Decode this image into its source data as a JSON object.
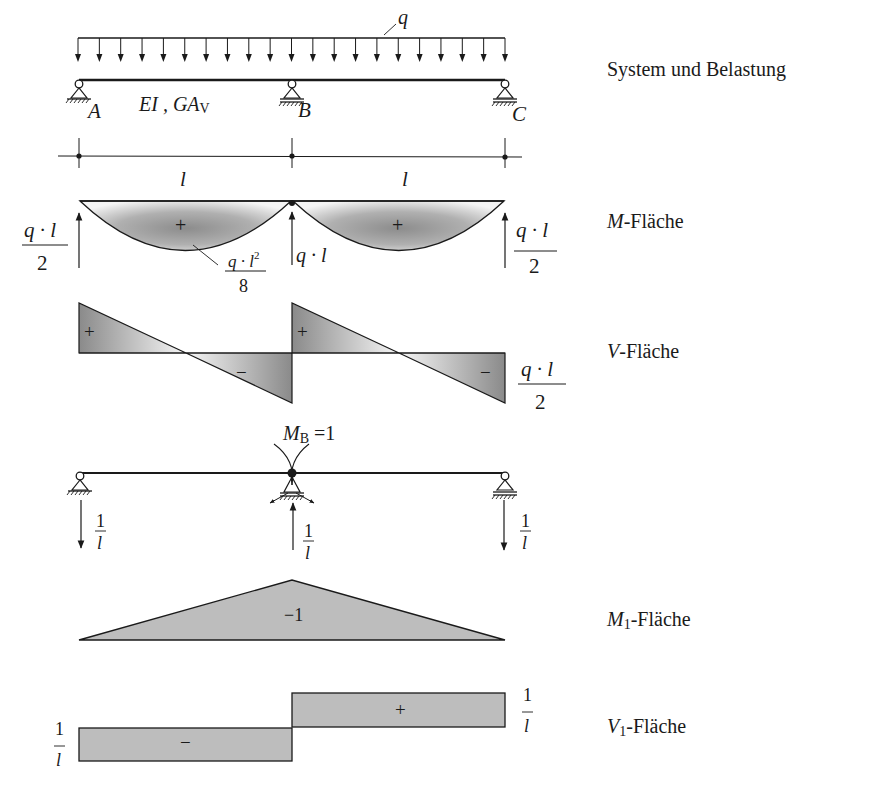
{
  "colors": {
    "ink": "#1a1a1a",
    "fill_gray": "#bdbdbd",
    "gradient_dark": "#8c8c8c",
    "gradient_light": "#f2f2f2"
  },
  "system": {
    "title": "System und Belastung",
    "load_label": "q",
    "stiffness_label": "EI , GA",
    "stiffness_sub": "V",
    "supports": [
      {
        "label": "A",
        "x": 79
      },
      {
        "label": "B",
        "x": 292
      },
      {
        "label": "C",
        "x": 505
      }
    ],
    "span_labels": [
      "l",
      "l"
    ],
    "load_arrow_count": 20
  },
  "m_diagram": {
    "title_var": "M",
    "title_rest": "-Fläche",
    "sign_left": "+",
    "sign_right": "+",
    "max_num": "q · l",
    "max_sup": "2",
    "max_den": "8",
    "reaction_end_num": "q · l",
    "reaction_end_den": "2",
    "reaction_mid": "q · l"
  },
  "v_diagram": {
    "title_var": "V",
    "title_rest": "-Fläche",
    "signs": [
      "+",
      "−",
      "+",
      "−"
    ],
    "value_num": "q · l",
    "value_den": "2"
  },
  "unit_system": {
    "moment_label": "M",
    "moment_sub": "B",
    "moment_value": " =1",
    "reaction_num": "1",
    "reaction_den": "l"
  },
  "m1_diagram": {
    "title_var": "M",
    "title_sub": "1",
    "title_rest": "-Fläche",
    "value": "−1"
  },
  "v1_diagram": {
    "title_var": "V",
    "title_sub": "1",
    "title_rest": "-Fläche",
    "sign_left": "−",
    "sign_right": "+",
    "value_num": "1",
    "value_den": "l"
  },
  "chart_data": {
    "type": "diagram",
    "spans": 2,
    "span_length": "l",
    "load": "uniform q",
    "M": {
      "field_max": "q·l²/8",
      "support_B": 0,
      "reactions": {
        "A": "q·l/2",
        "B": "q·l",
        "C": "q·l/2"
      }
    },
    "V": {
      "end_values": "±q·l/2"
    },
    "M1": {
      "at_B": -1,
      "at_A": 0,
      "at_C": 0
    },
    "V1": {
      "span1": "-1/l",
      "span2": "+1/l"
    }
  }
}
